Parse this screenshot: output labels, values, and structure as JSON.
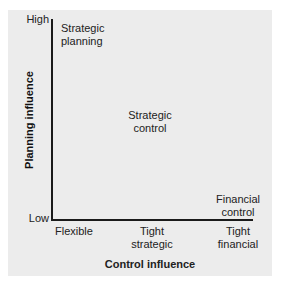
{
  "diagram": {
    "y_axis": {
      "title": "Planning influence",
      "high_label": "High",
      "low_label": "Low"
    },
    "x_axis": {
      "title": "Control influence",
      "ticks": [
        "Flexible",
        "Tight strategic",
        "Tight financial"
      ],
      "tick_lines": [
        [
          "Flexible"
        ],
        [
          "Tight",
          "strategic"
        ],
        [
          "Tight",
          "financial"
        ]
      ]
    },
    "styles": [
      {
        "name": "Strategic planning",
        "lines": [
          "Strategic",
          "planning"
        ],
        "position": "top-left"
      },
      {
        "name": "Strategic control",
        "lines": [
          "Strategic",
          "control"
        ],
        "position": "center"
      },
      {
        "name": "Financial control",
        "lines": [
          "Financial",
          "control"
        ],
        "position": "bottom-right"
      }
    ],
    "colors": {
      "panel": "#ececec",
      "axis": "#1a1a1a",
      "text": "#222222"
    }
  }
}
